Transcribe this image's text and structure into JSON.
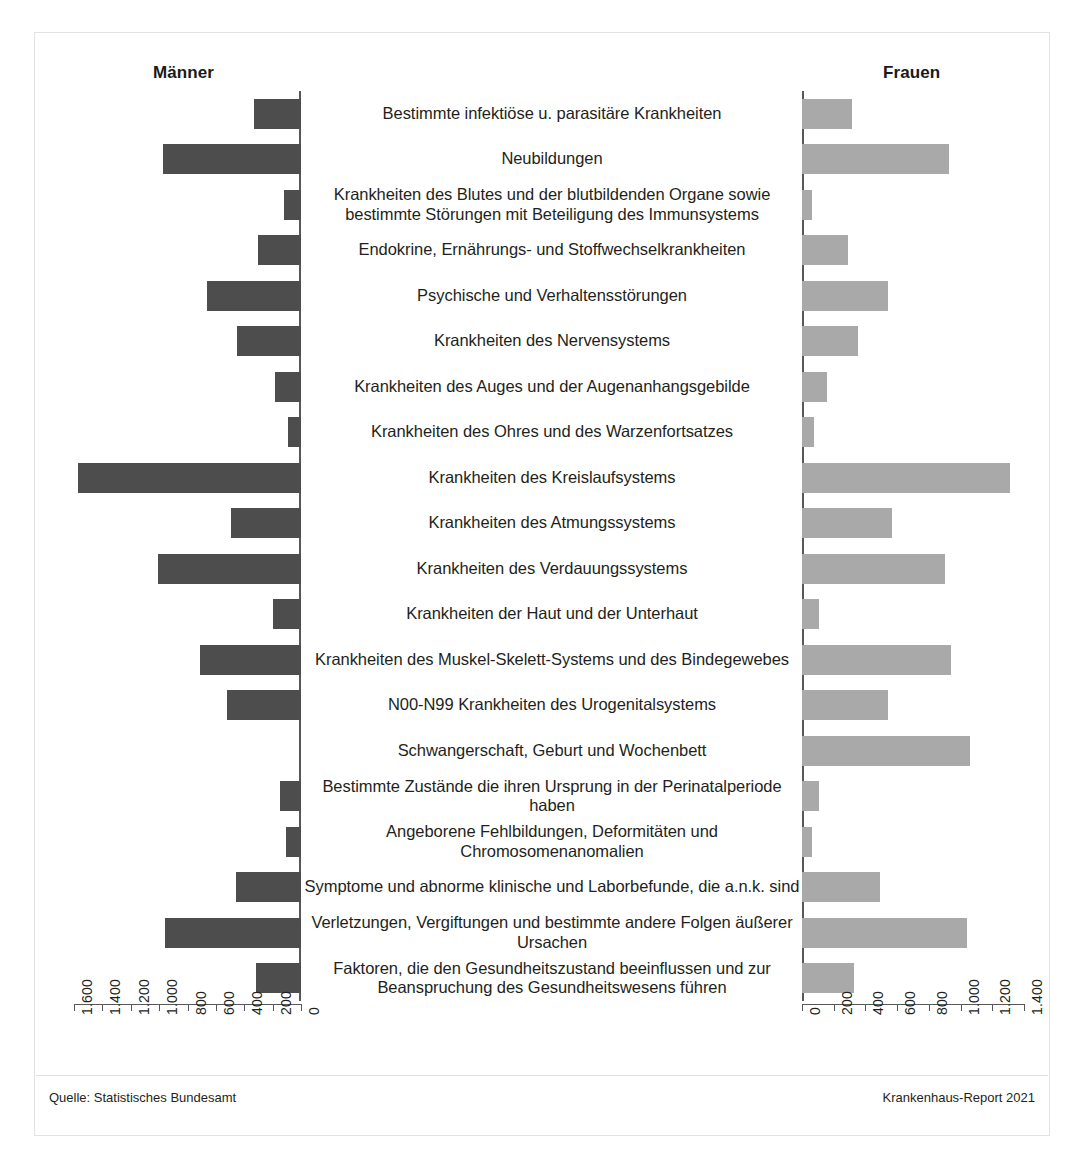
{
  "header": {
    "left_title": "Männer",
    "right_title": "Frauen"
  },
  "footer": {
    "source": "Quelle: Statistisches Bundesamt",
    "report": "Krankenhaus-Report 2021"
  },
  "axis": {
    "left_ticks": [
      "1.600",
      "1.400",
      "1.200",
      "1.000",
      "800",
      "600",
      "400",
      "200",
      "0"
    ],
    "right_ticks": [
      "0",
      "200",
      "400",
      "600",
      "800",
      "1.000",
      "1.200",
      "1.400"
    ]
  },
  "chart_data": {
    "type": "bar",
    "subtype": "diverging-population-pyramid",
    "title": "",
    "xlabel": "",
    "ylabel": "",
    "grid": false,
    "legend_position": "top",
    "left_axis": {
      "name": "Männer",
      "direction": "right-to-left",
      "range": [
        0,
        1600
      ],
      "tick_step": 200,
      "color": "#4d4d4d"
    },
    "right_axis": {
      "name": "Frauen",
      "direction": "left-to-right",
      "range": [
        0,
        1400
      ],
      "tick_step": 200,
      "color": "#a9a9a9"
    },
    "categories": [
      "Bestimmte infektiöse u. parasitäre Krankheiten",
      "Neubildungen",
      "Krankheiten des Blutes und der blutbildenden Organe sowie bestimmte Störungen mit Beteiligung des Immunsystems",
      "Endokrine, Ernährungs- und Stoffwechselkrankheiten",
      "Psychische und Verhaltensstörungen",
      "Krankheiten des Nervensystems",
      "Krankheiten des Auges und der Augenanhangsgebilde",
      "Krankheiten des Ohres und des Warzenfortsatzes",
      "Krankheiten des Kreislaufsystems",
      "Krankheiten des Atmungssystems",
      "Krankheiten des Verdauungssystems",
      "Krankheiten der Haut und der Unterhaut",
      "Krankheiten des Muskel-Skelett-Systems und des Bindegewebes",
      "N00-N99 Krankheiten des Urogenitalsystems",
      "Schwangerschaft, Geburt und Wochenbett",
      "Bestimmte Zustände die ihren Ursprung in der Perinatalperiode haben",
      "Angeborene Fehlbildungen, Deformitäten und Chromosomenanomalien",
      "Symptome und abnorme klinische und Laborbefunde, die a.n.k. sind",
      "Verletzungen, Vergiftungen und bestimmte andere Folgen äußerer Ursachen",
      "Faktoren, die den Gesundheitszustand beeinflussen und zur Beanspruchung des Gesundheitswesens führen"
    ],
    "series": [
      {
        "name": "Männer",
        "color": "#4d4d4d",
        "values": [
          330,
          970,
          120,
          300,
          660,
          450,
          180,
          90,
          1570,
          490,
          1010,
          200,
          710,
          520,
          0,
          150,
          105,
          460,
          960,
          320
        ]
      },
      {
        "name": "Frauen",
        "color": "#a9a9a9",
        "values": [
          315,
          930,
          65,
          290,
          540,
          350,
          160,
          75,
          1310,
          570,
          900,
          110,
          940,
          545,
          1060,
          110,
          65,
          490,
          1040,
          330
        ]
      }
    ]
  }
}
